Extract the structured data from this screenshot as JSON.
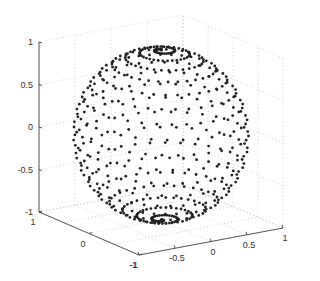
{
  "chart_data": {
    "type": "scatter3d",
    "title": "",
    "xlabel": "",
    "ylabel": "",
    "zlabel": "",
    "xlim": [
      -1,
      1
    ],
    "ylim": [
      -1,
      1
    ],
    "zlim": [
      -1,
      1
    ],
    "grid": true,
    "legend": null,
    "x_ticks": [
      "-1",
      "-0.5",
      "0",
      "0.5",
      "1"
    ],
    "y_ticks": [
      "1",
      "0",
      "-1"
    ],
    "z_ticks": [
      "1",
      "0.5",
      "0",
      "-0.5",
      "-1"
    ],
    "marker": {
      "shape": "dot",
      "color": "#222222",
      "size": 1.4
    },
    "series": [
      {
        "name": "unit sphere points",
        "description": "Points sampled on the unit sphere x^2+y^2+z^2=1 along a spherical spiral, denser near the poles",
        "sampling": {
          "method": "spiral",
          "count": 600,
          "turns": 18
        }
      }
    ]
  },
  "colors": {
    "background": "#ffffff",
    "axis": "#444444",
    "grid": "#c8c8c8",
    "points": "#222222"
  }
}
